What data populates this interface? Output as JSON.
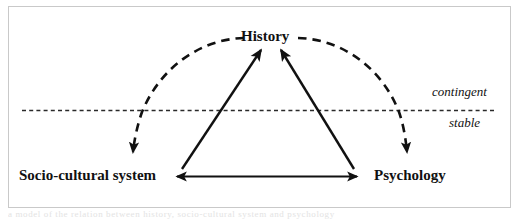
{
  "figure": {
    "type": "conceptual-diagram",
    "border_color": "#c9c9c9",
    "background": "#ffffff",
    "line_color": "#111111"
  },
  "nodes": {
    "history": "History",
    "socio_cultural_system": "Socio-cultural system",
    "psychology": "Psychology"
  },
  "zones": {
    "above_line": "contingent",
    "below_line": "stable",
    "divider": "horizontal dashed line"
  },
  "connections": [
    {
      "id": "socio-to-history",
      "style": "solid",
      "from": "Socio-cultural system",
      "to": "History",
      "arrows": "to"
    },
    {
      "id": "psychology-to-history",
      "style": "solid",
      "from": "Psychology",
      "to": "History",
      "arrows": "to"
    },
    {
      "id": "socio-psychology",
      "style": "solid",
      "from": "Socio-cultural system",
      "to": "Psychology",
      "arrows": "both"
    },
    {
      "id": "history-to-socio-arc",
      "style": "dashed",
      "from": "History",
      "to": "Socio-cultural system",
      "arrows": "to"
    },
    {
      "id": "history-to-psychology-arc",
      "style": "dashed",
      "from": "History",
      "to": "Psychology",
      "arrows": "to"
    }
  ],
  "caption": {
    "clipped_text": "a model of the relation between history, socio-cultural system and psychology"
  }
}
